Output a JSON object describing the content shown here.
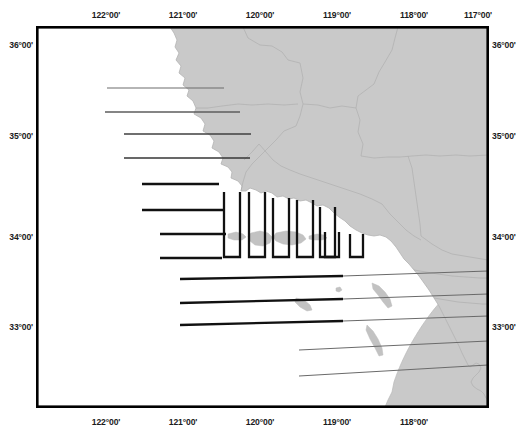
{
  "figure": {
    "type": "map",
    "title": "",
    "background_color": "#ffffff",
    "frame": {
      "x": 36,
      "y": 26,
      "width": 453,
      "height": 382,
      "stroke_color": "#000000",
      "stroke_width": 2.6
    }
  },
  "projection": {
    "lon_min": -122.62,
    "lon_max": -116.78,
    "lat_min": 32.22,
    "lat_max": 36.32
  },
  "axes": {
    "longitude": {
      "ticks_top": [
        "122°00'",
        "121°00'",
        "120°00'",
        "119°00'",
        "118°00'",
        "117°00'"
      ],
      "ticks_bottom": [
        "122°00'",
        "121°00'",
        "120°00'",
        "119°00'",
        "118°00'"
      ],
      "tick_values": [
        -122,
        -121,
        -120,
        -119,
        -118,
        -117
      ]
    },
    "latitude": {
      "ticks_left": [
        "36°00'",
        "35°00'",
        "34°00'",
        "33°00'"
      ],
      "ticks_right": [
        "36°00'",
        "35°00'",
        "34°00'",
        "33°00'"
      ],
      "tick_values": [
        36,
        35,
        34,
        33
      ]
    }
  },
  "colors": {
    "land_fill": "#c9c9c9",
    "land_stroke": "#b4b4b4",
    "county_line": "#a7a7a7",
    "island_fill": "#c2c2c2",
    "transect_dark": "#111111",
    "transect_light": "#767676",
    "frame": "#000000",
    "ocean": "#ffffff",
    "label_text": "#1b1b1b"
  },
  "layers": {
    "land": {
      "name": "California mainland",
      "fill": "#c9c9c9"
    },
    "islands": [
      {
        "name": "San Miguel Island"
      },
      {
        "name": "Santa Rosa Island"
      },
      {
        "name": "Santa Cruz Island"
      },
      {
        "name": "Anacapa Island"
      },
      {
        "name": "San Nicolas Island"
      },
      {
        "name": "Santa Barbara Island"
      },
      {
        "name": "Santa Catalina Island"
      },
      {
        "name": "San Clemente Island"
      }
    ],
    "county_boundaries": {
      "name": "county boundaries",
      "visible": true
    }
  },
  "transects": {
    "label": "survey transect lines",
    "horizontal_north": [
      {
        "id": "N1",
        "y": 88,
        "x1": 107,
        "x2": 224,
        "weight": 1.1,
        "color": "#6f6f6f"
      },
      {
        "id": "N2",
        "y": 112,
        "x1": 105,
        "x2": 240,
        "weight": 1.2,
        "color": "#5f5f5f"
      },
      {
        "id": "N3",
        "y": 134,
        "x1": 124,
        "x2": 250,
        "weight": 1.3,
        "color": "#444444"
      },
      {
        "id": "N4",
        "y": 158,
        "x1": 124,
        "x2": 249,
        "weight": 1.4,
        "color": "#3a3a3a"
      },
      {
        "id": "N5",
        "y": 184,
        "x1": 142,
        "x2": 218,
        "weight": 2.2,
        "color": "#111111"
      },
      {
        "id": "N6",
        "y": 210,
        "x1": 142,
        "x2": 224,
        "weight": 2.2,
        "color": "#111111"
      },
      {
        "id": "N7",
        "y": 234,
        "x1": 160,
        "x2": 225,
        "weight": 2.2,
        "color": "#111111"
      },
      {
        "id": "N8",
        "y": 258,
        "x1": 160,
        "x2": 221,
        "weight": 2.2,
        "color": "#111111"
      }
    ],
    "u_shaped": [
      {
        "id": "U1",
        "x1": 224,
        "x2": 240,
        "y_top": 192,
        "y_bot": 257
      },
      {
        "id": "U2",
        "x1": 249,
        "x2": 265,
        "y_top": 192,
        "y_bot": 257
      },
      {
        "id": "U3",
        "x1": 273,
        "x2": 289,
        "y_top": 198,
        "y_bot": 257
      },
      {
        "id": "U4",
        "x1": 297,
        "x2": 313,
        "y_top": 200,
        "y_bot": 257
      },
      {
        "id": "U5",
        "x1": 320,
        "x2": 335,
        "y_top": 207,
        "y_bot": 257
      },
      {
        "id": "U6",
        "x1": 324,
        "x2": 338,
        "y_top": 232,
        "y_bot": 257
      },
      {
        "id": "U7",
        "x1": 350,
        "x2": 363,
        "y_top": 234,
        "y_bot": 257
      }
    ],
    "horizontal_south": [
      {
        "id": "S1",
        "y1": 279,
        "y2": 273,
        "x1": 180,
        "x2": 489,
        "weight_a": 2.2,
        "weight_b": 1.0,
        "split": 340
      },
      {
        "id": "S2",
        "y1": 303,
        "y2": 296,
        "x1": 180,
        "x2": 489,
        "weight_a": 2.2,
        "weight_b": 1.0,
        "split": 340
      },
      {
        "id": "S3",
        "y1": 325,
        "y2": 318,
        "x1": 180,
        "x2": 489,
        "weight_a": 2.2,
        "weight_b": 1.0,
        "split": 340
      },
      {
        "id": "S4",
        "y1": 349,
        "y2": 341,
        "x1": 300,
        "x2": 489,
        "weight_a": 1.0,
        "weight_b": 1.0,
        "split": 489
      },
      {
        "id": "S5",
        "y1": 375,
        "y2": 366,
        "x1": 300,
        "x2": 489,
        "weight_a": 1.0,
        "weight_b": 1.0,
        "split": 489
      }
    ]
  }
}
